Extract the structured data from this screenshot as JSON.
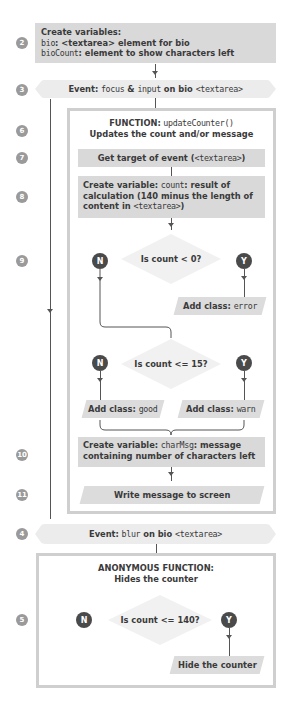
{
  "steps": {
    "s2": "2",
    "s3": "3",
    "s6": "6",
    "s7": "7",
    "s8": "8",
    "s9": "9",
    "s10": "10",
    "s11": "11",
    "s4": "4",
    "s5": "5"
  },
  "create_vars": {
    "title": "Create variables:",
    "line1_code": "bio",
    "line1_rest": ": <textarea> element for bio",
    "line2_code": "bioCount",
    "line2_rest": ": element to show characters left"
  },
  "event_focus": {
    "label": "Event:",
    "code1": "focus",
    "amp": " & ",
    "code2": "input",
    "on": " on bio ",
    "target": "<textarea>"
  },
  "function_update": {
    "label": "FUNCTION:",
    "name": "updateCounter()",
    "subtitle": "Updates the count and/or message",
    "get_target": "Get target of event (",
    "get_target_code": "<textarea>",
    "get_target_end": ")",
    "count_label": "Create variable:",
    "count_code": "count",
    "count_rest": ": result of calculation (140 minus the length of content in ",
    "count_code2": "<textarea>",
    "count_end": ")",
    "decision1": "Is count < 0?",
    "decision1_no": "N",
    "decision1_yes": "Y",
    "add_error_label": "Add class: ",
    "add_error_code": "error",
    "decision2": "Is count <= 15?",
    "decision2_no": "N",
    "decision2_yes": "Y",
    "add_good_label": "Add class: ",
    "add_good_code": "good",
    "add_warn_label": "Add class: ",
    "add_warn_code": "warn",
    "charmsg_label": "Create variable:",
    "charmsg_code": "charMsg",
    "charmsg_rest": ": message containing number of characters left",
    "write_message": "Write message to screen"
  },
  "event_blur": {
    "label": "Event:",
    "code": "blur",
    "on": " on bio ",
    "target": "<textarea>"
  },
  "function_anon": {
    "title": "ANONYMOUS FUNCTION:",
    "subtitle": "Hides the counter",
    "decision": "Is count <= 140?",
    "no": "N",
    "yes": "Y",
    "hide": "Hide the counter"
  },
  "colors": {
    "box_fill": "#d9d9d9",
    "event_fill": "#ececec",
    "frame_border": "#cfcfcf",
    "step_circle": "#9a9a9a",
    "yn_circle": "#4a4a4a",
    "text": "#3a3a3a"
  }
}
